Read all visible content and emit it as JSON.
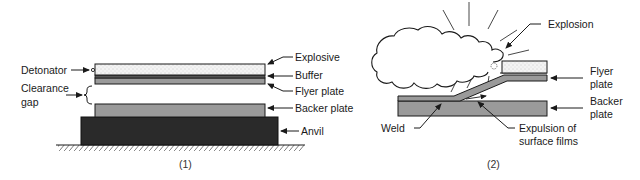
{
  "panel1": {
    "caption": "(1)",
    "labels": {
      "detonator": "Detonator",
      "clearance_gap_line1": "Clearance",
      "clearance_gap_line2": "gap",
      "explosive": "Explosive",
      "buffer": "Buffer",
      "flyer_plate": "Flyer plate",
      "backer_plate": "Backer plate",
      "anvil": "Anvil"
    }
  },
  "panel2": {
    "caption": "(2)",
    "labels": {
      "explosion": "Explosion",
      "flyer_plate_line1": "Flyer",
      "flyer_plate_line2": "plate",
      "backer_plate_line1": "Backer",
      "backer_plate_line2": "plate",
      "weld": "Weld",
      "expulsion_line1": "Expulsion of",
      "expulsion_line2": "surface films"
    }
  },
  "colors": {
    "outline": "#1a1a1a",
    "explosive_fill": "#f2f2f2",
    "plate_fill": "#9a9a9a",
    "anvil_fill": "#2a2a2a"
  }
}
